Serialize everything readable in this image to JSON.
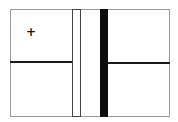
{
  "diagram": {
    "marker_symbol": "+",
    "colors": {
      "frame_border": "#9a9a9a",
      "divider_line": "#1a1a1a",
      "white_bar_fill": "#ffffff",
      "white_bar_border": "#444444",
      "black_bar_fill": "#0d0d0d",
      "background": "#ffffff"
    },
    "elements": [
      {
        "type": "frame",
        "label": ""
      },
      {
        "type": "white-vertical-bar",
        "label": ""
      },
      {
        "type": "black-vertical-bar",
        "label": ""
      },
      {
        "type": "left-horizontal-divider",
        "label": ""
      },
      {
        "type": "right-horizontal-divider",
        "label": ""
      },
      {
        "type": "plus-marker",
        "label": "+"
      }
    ]
  }
}
